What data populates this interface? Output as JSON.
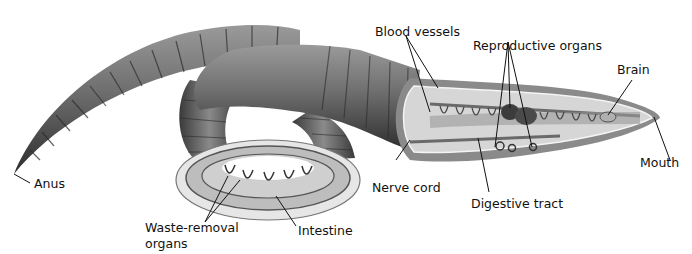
{
  "diagram": {
    "labels": {
      "blood_vessels": "Blood vessels",
      "reproductive_organs": "Reproductive organs",
      "brain": "Brain",
      "mouth": "Mouth",
      "anus": "Anus",
      "nerve_cord": "Nerve cord",
      "digestive_tract": "Digestive tract",
      "waste_removal_line1": "Waste-removal",
      "waste_removal_line2": "organs",
      "intestine": "Intestine"
    },
    "colors": {
      "body_dark": "#3a3a3a",
      "body_mid": "#7a7a7a",
      "body_light": "#b8b8b8",
      "cutaway_fill": "#c9c9c9",
      "cutaway_inner": "#dcdcdc",
      "leader_line": "#111111"
    }
  }
}
